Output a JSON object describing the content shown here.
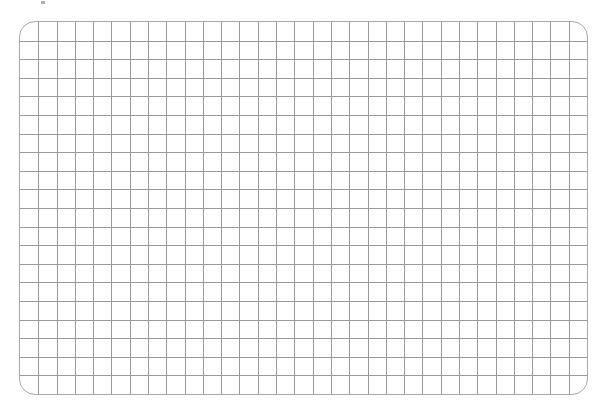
{
  "grid": {
    "columns": 31,
    "rows": 20,
    "line_color": "#9a9a9a",
    "border_color": "#a8a8a8",
    "background": "#ffffff",
    "corner_radius": 16
  }
}
